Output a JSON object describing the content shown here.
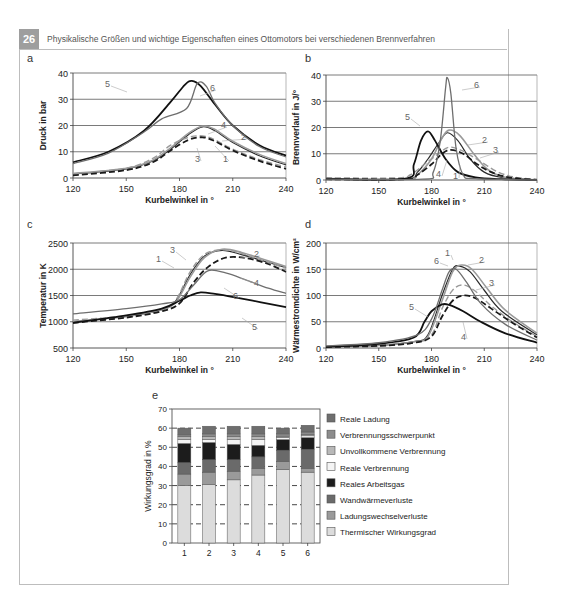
{
  "header": {
    "number": "26",
    "title": "Physikalische Größen und wichtige Eigenschaften eines Ottomotors bei verschiedenen Brennverfahren"
  },
  "colors": {
    "badge": "#9e9e9e",
    "frame": "#bdbdbd",
    "gridline": "#6b6b6b",
    "curve_dark": "#1a1a1a",
    "curve_gray": "#8a8a8a"
  },
  "chart_data": [
    {
      "panel": "a",
      "type": "line",
      "title": "",
      "xlabel": "Kurbelwinkel in °",
      "ylabel": "Druck in bar",
      "xlim": [
        120,
        240
      ],
      "ylim": [
        0,
        40
      ],
      "xticks": [
        120,
        150,
        180,
        210,
        240
      ],
      "yticks": [
        0,
        10,
        20,
        30,
        40
      ],
      "grid": "horizontal",
      "series": [
        {
          "name": "1",
          "x": [
            120,
            150,
            165,
            175,
            185,
            193,
            200,
            210,
            225,
            240
          ],
          "y": [
            1.5,
            3.5,
            6.5,
            11,
            16.5,
            19.5,
            18,
            13.5,
            8.5,
            5
          ]
        },
        {
          "name": "2",
          "x": [
            120,
            150,
            165,
            175,
            185,
            193,
            200,
            210,
            225,
            240
          ],
          "y": [
            1.7,
            3.7,
            6.8,
            11.5,
            17,
            19.8,
            18.5,
            14,
            9,
            5.5
          ]
        },
        {
          "name": "3",
          "x": [
            120,
            150,
            165,
            175,
            185,
            193,
            200,
            210,
            225,
            240
          ],
          "y": [
            1.5,
            3.8,
            7.5,
            12.5,
            15.5,
            16,
            14.5,
            11,
            7,
            4.2
          ]
        },
        {
          "name": "4",
          "x": [
            120,
            150,
            165,
            175,
            185,
            193,
            200,
            210,
            225,
            240
          ],
          "y": [
            1,
            3,
            6,
            10.5,
            14.5,
            15.5,
            14,
            10.5,
            6.5,
            3.5
          ]
        },
        {
          "name": "5",
          "x": [
            120,
            140,
            160,
            175,
            183,
            187,
            192,
            200,
            210,
            225,
            240
          ],
          "y": [
            6,
            10,
            18,
            29,
            35.5,
            37,
            35,
            28,
            20,
            12.5,
            8.5
          ]
        },
        {
          "name": "6",
          "x": [
            120,
            140,
            160,
            170,
            184,
            190,
            195,
            200,
            210,
            225,
            240
          ],
          "y": [
            5.5,
            9.5,
            17.5,
            22.5,
            26.5,
            36,
            35,
            28.5,
            20,
            12,
            8
          ]
        }
      ]
    },
    {
      "panel": "b",
      "type": "line",
      "title": "",
      "xlabel": "Kurbelwinkel in °",
      "ylabel": "Brennverlauf in J/°",
      "xlim": [
        120,
        240
      ],
      "ylim": [
        0,
        40
      ],
      "xticks": [
        120,
        150,
        180,
        210,
        240
      ],
      "yticks": [
        0,
        10,
        20,
        30,
        40
      ],
      "grid": "horizontal",
      "series": [
        {
          "name": "1",
          "x": [
            120,
            165,
            172,
            178,
            184,
            189,
            195,
            202,
            210,
            220,
            240
          ],
          "y": [
            0.3,
            0.3,
            3,
            8,
            14,
            18,
            15,
            8,
            3,
            1,
            0
          ]
        },
        {
          "name": "2",
          "x": [
            120,
            165,
            172,
            180,
            186,
            190,
            196,
            204,
            212,
            222,
            240
          ],
          "y": [
            0.3,
            0.3,
            2,
            8,
            16,
            19,
            17,
            10,
            4,
            1,
            0
          ]
        },
        {
          "name": "3",
          "x": [
            120,
            160,
            168,
            176,
            184,
            190,
            198,
            208,
            218,
            228,
            240
          ],
          "y": [
            0.8,
            0.8,
            2,
            6,
            10,
            12.5,
            11,
            7,
            3,
            1,
            0.3
          ]
        },
        {
          "name": "4",
          "x": [
            120,
            165,
            172,
            180,
            186,
            191,
            198,
            206,
            214,
            224,
            240
          ],
          "y": [
            0.3,
            0.3,
            2,
            6,
            10,
            11.5,
            10,
            6,
            3,
            1,
            0
          ]
        },
        {
          "name": "5",
          "x": [
            120,
            165,
            170,
            174,
            178,
            182,
            188,
            195,
            205,
            220,
            240
          ],
          "y": [
            0.5,
            0.5,
            6,
            15,
            18.5,
            15,
            8,
            3,
            1,
            0.3,
            0
          ]
        },
        {
          "name": "6",
          "x": [
            120,
            175,
            181,
            185,
            188,
            189,
            191,
            194,
            198,
            205,
            240
          ],
          "y": [
            0.3,
            0.3,
            3,
            15,
            35,
            39,
            33,
            12,
            2,
            0.5,
            0
          ]
        }
      ]
    },
    {
      "panel": "c",
      "type": "line",
      "title": "",
      "xlabel": "Kurbelwinkel in °",
      "ylabel": "Temperatur in K",
      "xlim": [
        120,
        240
      ],
      "ylim": [
        500,
        2500
      ],
      "xticks": [
        120,
        150,
        180,
        210,
        240
      ],
      "yticks": [
        500,
        1000,
        1500,
        2000,
        2500
      ],
      "grid": "horizontal",
      "series": [
        {
          "name": "1",
          "x": [
            120,
            150,
            170,
            178,
            186,
            194,
            204,
            215,
            228,
            240
          ],
          "y": [
            1000,
            1100,
            1230,
            1400,
            1900,
            2250,
            2360,
            2280,
            2150,
            2030
          ]
        },
        {
          "name": "2",
          "x": [
            120,
            150,
            170,
            178,
            186,
            194,
            204,
            215,
            228,
            240
          ],
          "y": [
            1000,
            1100,
            1230,
            1380,
            1850,
            2220,
            2380,
            2320,
            2180,
            2050
          ]
        },
        {
          "name": "3",
          "x": [
            120,
            150,
            170,
            178,
            186,
            194,
            204,
            215,
            228,
            240
          ],
          "y": [
            1030,
            1110,
            1240,
            1420,
            1950,
            2280,
            2370,
            2300,
            2150,
            2020
          ]
        },
        {
          "name": "4",
          "x": [
            120,
            150,
            170,
            180,
            188,
            196,
            206,
            218,
            230,
            240
          ],
          "y": [
            980,
            1080,
            1200,
            1350,
            1750,
            2040,
            2220,
            2210,
            2100,
            1950
          ]
        },
        {
          "name": "5",
          "x": [
            120,
            150,
            170,
            180,
            186,
            192,
            200,
            212,
            226,
            240
          ],
          "y": [
            980,
            1120,
            1250,
            1400,
            1500,
            1560,
            1530,
            1460,
            1370,
            1280
          ]
        },
        {
          "name": "6",
          "x": [
            120,
            150,
            170,
            180,
            188,
            196,
            206,
            218,
            230,
            240
          ],
          "y": [
            1150,
            1250,
            1340,
            1420,
            1700,
            1970,
            1930,
            1790,
            1640,
            1540
          ]
        }
      ]
    },
    {
      "panel": "d",
      "type": "line",
      "title": "",
      "xlabel": "Kurbelwinkel in °",
      "ylabel": "Wärmestromdichte in W/cm²",
      "xlim": [
        120,
        240
      ],
      "ylim": [
        0,
        200
      ],
      "xticks": [
        120,
        150,
        180,
        210,
        240
      ],
      "yticks": [
        0,
        50,
        100,
        150,
        200
      ],
      "grid": "horizontal",
      "series": [
        {
          "name": "1",
          "x": [
            120,
            150,
            170,
            178,
            186,
            192,
            196,
            202,
            210,
            220,
            240
          ],
          "y": [
            3,
            5,
            12,
            25,
            100,
            150,
            156,
            145,
            110,
            70,
            25
          ]
        },
        {
          "name": "2",
          "x": [
            120,
            150,
            170,
            178,
            186,
            192,
            197,
            203,
            212,
            222,
            240
          ],
          "y": [
            3,
            5,
            12,
            22,
            90,
            145,
            158,
            150,
            112,
            72,
            28
          ]
        },
        {
          "name": "3",
          "x": [
            120,
            150,
            170,
            180,
            186,
            192,
            198,
            205,
            214,
            226,
            240
          ],
          "y": [
            2,
            4,
            10,
            25,
            75,
            110,
            120,
            108,
            80,
            50,
            22
          ]
        },
        {
          "name": "4",
          "x": [
            120,
            150,
            170,
            180,
            186,
            192,
            198,
            205,
            214,
            226,
            240
          ],
          "y": [
            2,
            4,
            10,
            22,
            60,
            90,
            100,
            95,
            75,
            48,
            20
          ]
        },
        {
          "name": "5",
          "x": [
            120,
            150,
            170,
            176,
            180,
            186,
            190,
            198,
            208,
            222,
            240
          ],
          "y": [
            2,
            8,
            20,
            50,
            70,
            83,
            82,
            70,
            50,
            28,
            10
          ]
        },
        {
          "name": "6",
          "x": [
            120,
            150,
            172,
            180,
            186,
            190,
            194,
            200,
            208,
            222,
            240
          ],
          "y": [
            4,
            10,
            25,
            55,
            110,
            145,
            150,
            125,
            85,
            45,
            15
          ]
        }
      ]
    },
    {
      "panel": "e",
      "type": "bar",
      "stacked": true,
      "title": "",
      "xlabel": "",
      "ylabel": "Wirkungsgrad in %",
      "ylim": [
        0,
        70
      ],
      "yticks": [
        0,
        10,
        20,
        30,
        40,
        50,
        60,
        70
      ],
      "grid": "horizontal-dashed",
      "legend_position": "right",
      "categories": [
        "1",
        "2",
        "3",
        "4",
        "5",
        "6"
      ],
      "series": [
        {
          "name": "Thermischer Wirkungsgrad",
          "color": "#dcdcdc",
          "values": [
            30,
            30.5,
            33,
            35.5,
            38.5,
            37
          ]
        },
        {
          "name": "Ladungswechselverluste",
          "color": "#9a9a9a",
          "values": [
            6,
            6.5,
            4.5,
            3.5,
            4,
            2
          ]
        },
        {
          "name": "Wandwärmeverluste",
          "color": "#6a6a6a",
          "values": [
            6,
            6.5,
            6,
            6,
            6,
            10
          ]
        },
        {
          "name": "Reales Arbeitsgas",
          "color": "#1c1c1c",
          "values": [
            10,
            9,
            8,
            6,
            5.5,
            6
          ]
        },
        {
          "name": "Reale Verbrennung",
          "color": "#f4f4f4",
          "values": [
            2,
            1.5,
            2.5,
            3,
            1,
            1
          ]
        },
        {
          "name": "Unvollkommene Verbrennung",
          "color": "#b8b8b8",
          "values": [
            1.5,
            1.5,
            1.5,
            1.5,
            0.8,
            0.8
          ]
        },
        {
          "name": "Verbrennungsschwerpunkt",
          "color": "#8c8c8c",
          "values": [
            1,
            1.5,
            1.5,
            1.5,
            1.2,
            1.2
          ]
        },
        {
          "name": "Reale Ladung",
          "color": "#6e6e6e",
          "values": [
            3.5,
            4,
            4,
            4,
            3,
            3.5
          ]
        }
      ]
    }
  ],
  "panels": {
    "a": {
      "letter": "a",
      "xlabel": "Kurbelwinkel in °",
      "ylabel": "Druck in bar",
      "xticks": [
        "120",
        "150",
        "180",
        "210",
        "240"
      ],
      "yticks": [
        "0",
        "10",
        "20",
        "30",
        "40"
      ],
      "curve_labels": [
        "1",
        "2",
        "3",
        "4",
        "5",
        "6"
      ]
    },
    "b": {
      "letter": "b",
      "xlabel": "Kurbelwinkel in °",
      "ylabel": "Brennverlauf in J/°",
      "xticks": [
        "120",
        "150",
        "180",
        "210",
        "240"
      ],
      "yticks": [
        "0",
        "10",
        "20",
        "30",
        "40"
      ],
      "curve_labels": [
        "1",
        "2",
        "3",
        "4",
        "5",
        "6"
      ]
    },
    "c": {
      "letter": "c",
      "xlabel": "Kurbelwinkel in °",
      "ylabel": "Temperatur in K",
      "xticks": [
        "120",
        "150",
        "180",
        "210",
        "240"
      ],
      "yticks": [
        "500",
        "1000",
        "1500",
        "2000",
        "2500"
      ],
      "curve_labels": [
        "1",
        "2",
        "3",
        "4",
        "5",
        "6"
      ]
    },
    "d": {
      "letter": "d",
      "xlabel": "Kurbelwinkel in °",
      "ylabel": "Wärmestromdichte in W/cm²",
      "xticks": [
        "120",
        "150",
        "180",
        "210",
        "240"
      ],
      "yticks": [
        "0",
        "50",
        "100",
        "150",
        "200"
      ],
      "curve_labels": [
        "1",
        "2",
        "3",
        "4",
        "5",
        "6"
      ]
    },
    "e": {
      "letter": "e",
      "ylabel": "Wirkungsgrad in %",
      "yticks": [
        "0",
        "10",
        "20",
        "30",
        "40",
        "50",
        "60",
        "70"
      ],
      "categories": [
        "1",
        "2",
        "3",
        "4",
        "5",
        "6"
      ],
      "legend": [
        "Reale Ladung",
        "Verbrennungsschwerpunkt",
        "Unvollkommene Verbrennung",
        "Reale Verbrennung",
        "Reales Arbeitsgas",
        "Wandwärmeverluste",
        "Ladungswechselverluste",
        "Thermischer Wirkungsgrad"
      ]
    }
  }
}
